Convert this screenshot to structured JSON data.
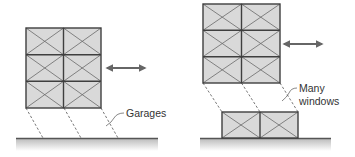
{
  "diagram": {
    "colors": {
      "panel_fill": "#d9d9d9",
      "frame_stroke": "#3f3f3f",
      "brace_stroke": "#6a6a6a",
      "ground_stroke": "#555555",
      "arrow": "#666666",
      "text": "#333333"
    },
    "left": {
      "label": "Garages",
      "description": "Three-story braced frame over open garage level (soft story)",
      "upper_frame": {
        "stories": 3,
        "bays": 2
      },
      "arrow": "bidirectional lateral motion"
    },
    "right": {
      "label_line1": "Many",
      "label_line2": "windows",
      "description": "Three-story braced frame over a ground story with many windows",
      "upper_frame": {
        "stories": 3,
        "bays": 2
      },
      "ground_frame": {
        "stories": 1,
        "bays": 2
      },
      "arrow": "bidirectional lateral motion"
    }
  }
}
